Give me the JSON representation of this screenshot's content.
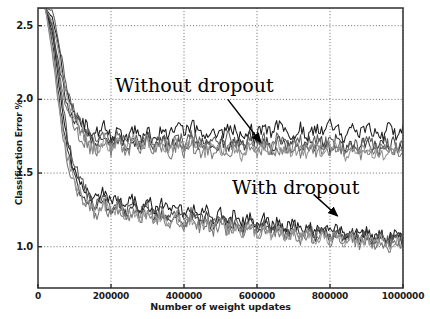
{
  "chart_data": {
    "type": "line",
    "title": "",
    "xlabel": "Number of weight updates",
    "ylabel": "Classification Error %",
    "xlim": [
      0,
      1000000
    ],
    "ylim": [
      0.72,
      2.62
    ],
    "grid": true,
    "legend_position": "none",
    "xticks": [
      0,
      200000,
      400000,
      600000,
      800000,
      1000000
    ],
    "xtick_labels": [
      "0",
      "200000",
      "400000",
      "600000",
      "800000",
      "1000000"
    ],
    "yticks": [
      1.0,
      1.5,
      2.0,
      2.5
    ],
    "ytick_labels": [
      "1.0",
      "1.5",
      "2.0",
      "2.5"
    ],
    "annotations": [
      {
        "text": "Without dropout",
        "x": 430000,
        "y": 2.12,
        "arrow_from": [
          520000,
          2.0
        ],
        "arrow_to": [
          610000,
          1.71
        ]
      },
      {
        "text": "With dropout",
        "x": 620000,
        "y": 1.46,
        "arrow_from": [
          755000,
          1.355
        ],
        "arrow_to": [
          820000,
          1.21
        ]
      }
    ],
    "groups": [
      {
        "name": "Without dropout",
        "description": "5 runs without dropout, plateau near 1.6-1.85% error",
        "plateau_range": [
          1.6,
          1.86
        ],
        "final_mean": 1.72,
        "series": [
          {
            "name": "no-dropout-run-1",
            "color": "#1c1c1c",
            "values": [
              2.62,
              2.62,
              2.55,
              2.3,
              2.02,
              1.9,
              1.84,
              1.8,
              1.78,
              1.82,
              1.75,
              1.79,
              1.72,
              1.8,
              1.74,
              1.78,
              1.73,
              1.8,
              1.76,
              1.82,
              1.77,
              1.83,
              1.78,
              1.74,
              1.8,
              1.76,
              1.82,
              1.78,
              1.73,
              1.8,
              1.76,
              1.81,
              1.77,
              1.83,
              1.78,
              1.74,
              1.81,
              1.76,
              1.82,
              1.78,
              1.84,
              1.79,
              1.75,
              1.81,
              1.77,
              1.83,
              1.78,
              1.74,
              1.8,
              1.76,
              1.82
            ]
          },
          {
            "name": "no-dropout-run-2",
            "color": "#3a3a3a",
            "values": [
              2.62,
              2.62,
              2.48,
              2.2,
              1.96,
              1.84,
              1.78,
              1.74,
              1.7,
              1.76,
              1.69,
              1.74,
              1.67,
              1.73,
              1.68,
              1.75,
              1.69,
              1.72,
              1.66,
              1.73,
              1.67,
              1.74,
              1.68,
              1.71,
              1.65,
              1.72,
              1.67,
              1.73,
              1.68,
              1.74,
              1.69,
              1.72,
              1.66,
              1.71,
              1.67,
              1.73,
              1.68,
              1.74,
              1.69,
              1.72,
              1.67,
              1.73,
              1.68,
              1.7,
              1.66,
              1.72,
              1.67,
              1.73,
              1.68,
              1.71,
              1.66
            ]
          },
          {
            "name": "no-dropout-run-3",
            "color": "#5c5c5c",
            "values": [
              2.62,
              2.62,
              2.6,
              2.35,
              2.06,
              1.92,
              1.82,
              1.76,
              1.72,
              1.79,
              1.71,
              1.77,
              1.7,
              1.76,
              1.71,
              1.77,
              1.7,
              1.75,
              1.69,
              1.76,
              1.7,
              1.77,
              1.71,
              1.68,
              1.74,
              1.69,
              1.75,
              1.7,
              1.66,
              1.72,
              1.67,
              1.74,
              1.68,
              1.75,
              1.69,
              1.66,
              1.72,
              1.67,
              1.73,
              1.68,
              1.74,
              1.69,
              1.65,
              1.71,
              1.67,
              1.73,
              1.68,
              1.64,
              1.7,
              1.66,
              1.72
            ]
          },
          {
            "name": "no-dropout-run-4",
            "color": "#7a7a7a",
            "values": [
              2.62,
              2.62,
              2.42,
              2.14,
              1.92,
              1.8,
              1.73,
              1.68,
              1.64,
              1.71,
              1.65,
              1.7,
              1.63,
              1.7,
              1.64,
              1.71,
              1.65,
              1.68,
              1.62,
              1.69,
              1.63,
              1.7,
              1.64,
              1.67,
              1.61,
              1.68,
              1.63,
              1.69,
              1.64,
              1.7,
              1.65,
              1.68,
              1.62,
              1.67,
              1.63,
              1.69,
              1.64,
              1.7,
              1.65,
              1.68,
              1.63,
              1.69,
              1.64,
              1.66,
              1.62,
              1.68,
              1.63,
              1.69,
              1.64,
              1.67,
              1.62
            ]
          },
          {
            "name": "no-dropout-run-5",
            "color": "#949494",
            "values": [
              2.62,
              2.62,
              2.52,
              2.26,
              1.98,
              1.86,
              1.76,
              1.7,
              1.66,
              1.73,
              1.67,
              1.72,
              1.66,
              1.72,
              1.67,
              1.73,
              1.66,
              1.71,
              1.65,
              1.71,
              1.66,
              1.72,
              1.67,
              1.64,
              1.7,
              1.65,
              1.71,
              1.66,
              1.62,
              1.68,
              1.63,
              1.7,
              1.64,
              1.71,
              1.65,
              1.62,
              1.68,
              1.63,
              1.69,
              1.64,
              1.7,
              1.65,
              1.61,
              1.67,
              1.63,
              1.69,
              1.64,
              1.6,
              1.66,
              1.62,
              1.68
            ]
          }
        ]
      },
      {
        "name": "With dropout",
        "description": "5 runs with dropout, plateau near 1.0-1.15% error",
        "plateau_range": [
          0.97,
          1.16
        ],
        "final_mean": 1.06,
        "series": [
          {
            "name": "dropout-run-1",
            "color": "#1c1c1c",
            "values": [
              2.62,
              2.62,
              2.45,
              2.05,
              1.72,
              1.52,
              1.42,
              1.36,
              1.32,
              1.38,
              1.3,
              1.35,
              1.28,
              1.33,
              1.26,
              1.32,
              1.25,
              1.3,
              1.23,
              1.28,
              1.22,
              1.27,
              1.21,
              1.25,
              1.19,
              1.24,
              1.18,
              1.22,
              1.16,
              1.21,
              1.15,
              1.19,
              1.13,
              1.18,
              1.12,
              1.16,
              1.11,
              1.15,
              1.1,
              1.14,
              1.09,
              1.13,
              1.08,
              1.12,
              1.07,
              1.11,
              1.06,
              1.1,
              1.05,
              1.09,
              1.04
            ]
          },
          {
            "name": "dropout-run-2",
            "color": "#333333",
            "values": [
              2.62,
              2.62,
              2.38,
              1.96,
              1.64,
              1.46,
              1.36,
              1.3,
              1.26,
              1.32,
              1.24,
              1.29,
              1.22,
              1.27,
              1.21,
              1.26,
              1.2,
              1.24,
              1.18,
              1.23,
              1.17,
              1.22,
              1.16,
              1.2,
              1.14,
              1.19,
              1.13,
              1.17,
              1.12,
              1.16,
              1.11,
              1.15,
              1.1,
              1.14,
              1.09,
              1.13,
              1.08,
              1.12,
              1.07,
              1.11,
              1.06,
              1.1,
              1.06,
              1.09,
              1.05,
              1.09,
              1.04,
              1.08,
              1.03,
              1.08,
              1.02
            ]
          },
          {
            "name": "dropout-run-3",
            "color": "#555555",
            "values": [
              2.62,
              2.62,
              2.5,
              2.12,
              1.76,
              1.56,
              1.44,
              1.34,
              1.28,
              1.34,
              1.26,
              1.31,
              1.24,
              1.29,
              1.22,
              1.28,
              1.21,
              1.26,
              1.19,
              1.24,
              1.18,
              1.23,
              1.17,
              1.21,
              1.15,
              1.2,
              1.14,
              1.18,
              1.13,
              1.17,
              1.12,
              1.15,
              1.1,
              1.14,
              1.09,
              1.13,
              1.08,
              1.12,
              1.07,
              1.11,
              1.06,
              1.1,
              1.05,
              1.09,
              1.04,
              1.08,
              1.04,
              1.07,
              1.03,
              1.07,
              1.02
            ]
          },
          {
            "name": "dropout-run-4",
            "color": "#777777",
            "values": [
              2.62,
              2.62,
              2.3,
              1.88,
              1.58,
              1.42,
              1.32,
              1.26,
              1.22,
              1.28,
              1.21,
              1.26,
              1.19,
              1.24,
              1.18,
              1.23,
              1.17,
              1.21,
              1.15,
              1.2,
              1.14,
              1.19,
              1.13,
              1.17,
              1.11,
              1.16,
              1.1,
              1.14,
              1.09,
              1.13,
              1.08,
              1.12,
              1.07,
              1.11,
              1.06,
              1.1,
              1.05,
              1.09,
              1.04,
              1.08,
              1.03,
              1.07,
              1.02,
              1.06,
              1.01,
              1.06,
              1.0,
              1.05,
              0.99,
              1.04,
              0.99
            ]
          },
          {
            "name": "dropout-run-5",
            "color": "#9a9a9a",
            "values": [
              2.62,
              2.62,
              2.34,
              1.92,
              1.62,
              1.44,
              1.34,
              1.28,
              1.24,
              1.3,
              1.22,
              1.28,
              1.2,
              1.26,
              1.19,
              1.24,
              1.18,
              1.22,
              1.16,
              1.21,
              1.15,
              1.2,
              1.14,
              1.18,
              1.12,
              1.17,
              1.11,
              1.15,
              1.1,
              1.14,
              1.09,
              1.13,
              1.08,
              1.12,
              1.07,
              1.11,
              1.06,
              1.1,
              1.05,
              1.09,
              1.04,
              1.08,
              1.03,
              1.07,
              1.02,
              1.07,
              1.01,
              1.06,
              1.0,
              1.05,
              1.0
            ]
          }
        ]
      }
    ]
  }
}
